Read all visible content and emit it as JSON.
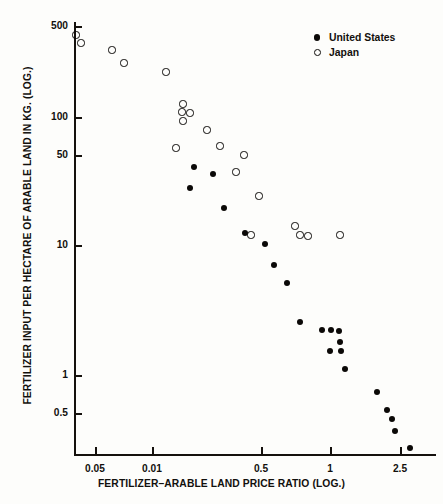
{
  "chart_data": {
    "type": "scatter",
    "title": "",
    "xlabel": "FERTILIZER–ARABLE LAND PRICE RATIO (LOG.)",
    "ylabel": "FERTILIZER INPUT PER HECTARE OF ARABLE LAND IN KG. (LOG.)",
    "xscale": "log",
    "yscale": "log",
    "grid": false,
    "legend_position": "top-right",
    "xticks": [
      "0.05",
      "0.01",
      "0.5",
      "1",
      "2.5"
    ],
    "xtick_positions_px": [
      95,
      152,
      261,
      330,
      400
    ],
    "yticks": [
      "500",
      "100",
      "50",
      "10",
      "1",
      "0.5"
    ],
    "ytick_values": [
      500,
      100,
      50,
      10,
      1,
      0.5
    ],
    "ytick_positions_px": [
      26,
      117,
      155,
      245,
      375,
      413
    ],
    "plot_box_px": {
      "left": 74,
      "top": 22,
      "right": 436,
      "bottom": 455
    },
    "series": [
      {
        "name": "United States",
        "marker": "filled-circle",
        "color": "#0b0907",
        "points_px": [
          [
            194,
            167
          ],
          [
            213,
            174
          ],
          [
            190,
            188
          ],
          [
            224,
            208
          ],
          [
            245,
            233
          ],
          [
            265,
            244
          ],
          [
            274,
            265
          ],
          [
            287,
            283
          ],
          [
            300,
            322
          ],
          [
            322,
            330
          ],
          [
            331,
            330
          ],
          [
            339,
            331
          ],
          [
            340,
            342
          ],
          [
            330,
            351
          ],
          [
            341,
            351
          ],
          [
            345,
            369
          ],
          [
            377,
            392
          ],
          [
            387,
            410
          ],
          [
            392,
            419
          ],
          [
            395,
            431
          ],
          [
            410,
            448
          ]
        ],
        "points_data": [
          [
            0.148,
            48.5
          ],
          [
            0.205,
            42.0
          ],
          [
            0.148,
            35.0
          ],
          [
            0.243,
            24.0
          ],
          [
            0.345,
            14.0
          ],
          [
            0.455,
            11.0
          ],
          [
            0.515,
            8.6
          ],
          [
            0.6,
            6.2
          ],
          [
            0.7,
            3.1
          ],
          [
            0.875,
            2.35
          ],
          [
            0.92,
            2.35
          ],
          [
            0.96,
            2.3
          ],
          [
            0.965,
            1.85
          ],
          [
            0.9,
            1.55
          ],
          [
            0.975,
            1.55
          ],
          [
            1.02,
            1.02
          ],
          [
            1.54,
            0.75
          ],
          [
            1.8,
            0.53
          ],
          [
            1.9,
            0.47
          ],
          [
            1.95,
            0.39
          ],
          [
            2.6,
            0.31
          ]
        ]
      },
      {
        "name": "Japan",
        "marker": "open-circle",
        "color": "#0b0907",
        "points_px": [
          [
            76,
            35
          ],
          [
            81,
            43
          ],
          [
            112,
            50
          ],
          [
            124,
            63
          ],
          [
            166,
            72
          ],
          [
            183,
            104
          ],
          [
            182,
            112
          ],
          [
            190,
            113
          ],
          [
            183,
            121
          ],
          [
            207,
            130
          ],
          [
            176,
            148
          ],
          [
            220,
            146
          ],
          [
            244,
            155
          ],
          [
            236,
            172
          ],
          [
            259,
            196
          ],
          [
            251,
            235
          ],
          [
            295,
            226
          ],
          [
            300,
            235
          ],
          [
            308,
            236
          ],
          [
            340,
            235
          ]
        ],
        "points_data": [
          [
            0.0325,
            430
          ],
          [
            0.034,
            390
          ],
          [
            0.058,
            350
          ],
          [
            0.068,
            305
          ],
          [
            0.0125,
            250
          ],
          [
            0.15,
            118
          ],
          [
            0.148,
            105
          ],
          [
            0.16,
            100
          ],
          [
            0.15,
            92
          ],
          [
            0.198,
            80
          ],
          [
            0.138,
            57
          ],
          [
            0.235,
            62
          ],
          [
            0.3,
            50
          ],
          [
            0.28,
            42
          ],
          [
            0.39,
            30
          ],
          [
            0.35,
            13
          ],
          [
            0.62,
            15.5
          ],
          [
            0.68,
            13.0
          ],
          [
            0.74,
            12.8
          ],
          [
            1.1,
            13.0
          ]
        ]
      }
    ]
  },
  "legend": {
    "items": [
      {
        "label": "United States",
        "marker": "filled-circle"
      },
      {
        "label": "Japan",
        "marker": "open-circle"
      }
    ]
  }
}
